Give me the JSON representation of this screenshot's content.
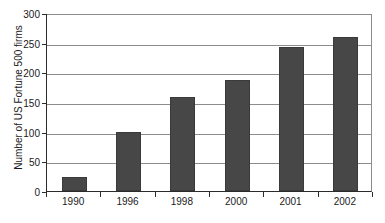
{
  "chart_data": {
    "type": "bar",
    "title": "",
    "xlabel": "",
    "ylabel": "Number of US Fortune 500 firms",
    "categories": [
      "1990",
      "1996",
      "1998",
      "2000",
      "2001",
      "2002"
    ],
    "values": [
      24,
      100,
      158,
      187,
      242,
      260
    ],
    "series": [
      {
        "name": "Number of US Fortune 500 firms",
        "values": [
          24,
          100,
          158,
          187,
          242,
          260
        ]
      }
    ],
    "ylim": [
      0,
      300
    ],
    "yticks": [
      0,
      50,
      100,
      150,
      200,
      250,
      300
    ],
    "ytick_labels": [
      "0",
      "50",
      "100",
      "150",
      "200",
      "250",
      "300"
    ],
    "grid": true,
    "grid_axis": "y",
    "legend": false,
    "legend_position": "none",
    "bar_color": "#474747",
    "grid_color": "#8c8c8c",
    "axis_color": "#2b2b2b",
    "background_color": "#ffffff",
    "annotations": []
  }
}
